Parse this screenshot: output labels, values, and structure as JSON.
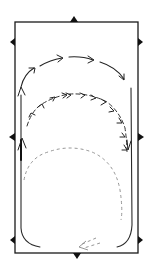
{
  "diagram": {
    "colors": {
      "ink": "#222222",
      "faint_ink": "#8a8a8a",
      "background": "#ffffff"
    },
    "markers": [
      {
        "id": "top-center",
        "side": "top"
      },
      {
        "id": "bottom-center",
        "side": "bottom"
      },
      {
        "id": "left-upper",
        "side": "left"
      },
      {
        "id": "left-middle",
        "side": "left"
      },
      {
        "id": "left-lower",
        "side": "left"
      },
      {
        "id": "right-upper",
        "side": "right"
      },
      {
        "id": "right-middle",
        "side": "right"
      },
      {
        "id": "right-lower",
        "side": "right"
      }
    ],
    "paths": [
      {
        "id": "outer-arc",
        "style": "solid-with-arrows",
        "direction": "clockwise",
        "description": "Large arc from left track over the top to the right track"
      },
      {
        "id": "inner-arc",
        "style": "dashed-with-arrows",
        "direction": "clockwise",
        "description": "Smaller dashed arc with many arrowheads, ending down the right side"
      },
      {
        "id": "lower-loop",
        "style": "faint-dashed",
        "description": "Faint dashed loop in the lower half returning to the bottom centre"
      },
      {
        "id": "track-left",
        "style": "solid",
        "description": "Track along left long side with upward arrow"
      },
      {
        "id": "track-right",
        "style": "solid",
        "description": "Track along right long side"
      }
    ]
  }
}
